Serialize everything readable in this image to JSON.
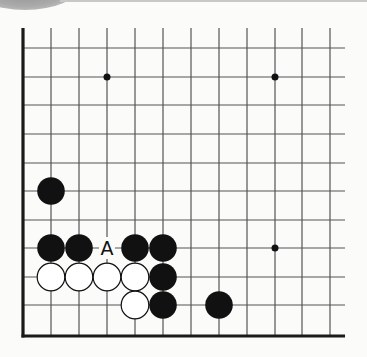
{
  "diagram": {
    "type": "go-board-fragment",
    "colors": {
      "line": "#555555",
      "border": "#1a1a1a",
      "black_stone": "#111111",
      "white_stone": "#ffffff",
      "background": "#fbfbfa"
    },
    "grid": {
      "columns_x": [
        23,
        51,
        79,
        107,
        135,
        163,
        191,
        219,
        247,
        275,
        302,
        330
      ],
      "rows_y": [
        48,
        77,
        105,
        134,
        163,
        191,
        220,
        248,
        277,
        305,
        336
      ],
      "top_y": 28,
      "right_x": 345,
      "left_border_x": 23,
      "bottom_border_y": 336
    },
    "star_points": [
      {
        "x": 107,
        "y": 77
      },
      {
        "x": 275,
        "y": 77
      },
      {
        "x": 275,
        "y": 248
      }
    ],
    "stones": [
      {
        "color": "black",
        "x": 51,
        "y": 191
      },
      {
        "color": "black",
        "x": 51,
        "y": 248
      },
      {
        "color": "black",
        "x": 79,
        "y": 248
      },
      {
        "color": "black",
        "x": 135,
        "y": 248
      },
      {
        "color": "black",
        "x": 163,
        "y": 248
      },
      {
        "color": "white",
        "x": 51,
        "y": 277
      },
      {
        "color": "white",
        "x": 79,
        "y": 277
      },
      {
        "color": "white",
        "x": 107,
        "y": 277
      },
      {
        "color": "white",
        "x": 135,
        "y": 277
      },
      {
        "color": "black",
        "x": 163,
        "y": 277
      },
      {
        "color": "white",
        "x": 135,
        "y": 305
      },
      {
        "color": "black",
        "x": 163,
        "y": 305
      },
      {
        "color": "black",
        "x": 219,
        "y": 305
      }
    ],
    "labels": [
      {
        "text": "A",
        "x": 107,
        "y": 248
      }
    ]
  }
}
